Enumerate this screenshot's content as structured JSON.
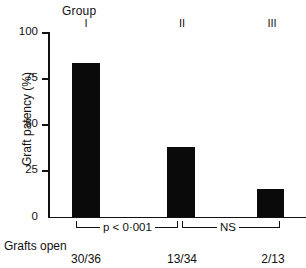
{
  "chart_data": {
    "type": "bar",
    "title": "",
    "xlabel": "Group",
    "ylabel": "Graft patency (%)",
    "categories": [
      "I",
      "II",
      "III"
    ],
    "values": [
      83,
      38,
      15
    ],
    "ylim": [
      0,
      100
    ],
    "yticks": [
      0,
      25,
      50,
      75,
      100
    ],
    "ytick_labels": [
      "0",
      "25",
      "50",
      "75",
      "100"
    ],
    "grid": false,
    "legend": "none",
    "bar_color": "#0a0a0a",
    "annotations": [
      {
        "label": "p < 0·001",
        "between": [
          "I",
          "II"
        ]
      },
      {
        "label": "NS",
        "between": [
          "II",
          "III"
        ]
      }
    ],
    "data_labels_row": {
      "label": "Grafts open",
      "values": [
        "30/36",
        "13/34",
        "2/13"
      ]
    }
  },
  "header": {
    "group_word": "Group"
  }
}
